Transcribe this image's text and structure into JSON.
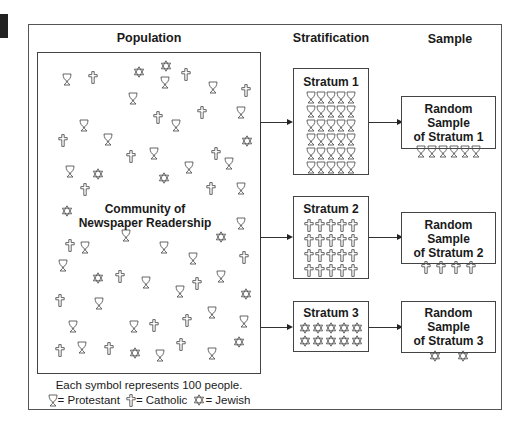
{
  "titles": {
    "population": "Population",
    "stratification": "Stratification",
    "sample": "Sample"
  },
  "population": {
    "label_line1": "Community of",
    "label_line2": "Newspaper Readership",
    "symbols": [
      {
        "t": "P",
        "x": 62,
        "y": 73
      },
      {
        "t": "C",
        "x": 88,
        "y": 71
      },
      {
        "t": "J",
        "x": 133,
        "y": 66
      },
      {
        "t": "P",
        "x": 160,
        "y": 76
      },
      {
        "t": "C",
        "x": 181,
        "y": 68
      },
      {
        "t": "P",
        "x": 208,
        "y": 81
      },
      {
        "t": "C",
        "x": 241,
        "y": 84
      },
      {
        "t": "P",
        "x": 128,
        "y": 92
      },
      {
        "t": "C",
        "x": 153,
        "y": 111
      },
      {
        "t": "C",
        "x": 197,
        "y": 106
      },
      {
        "t": "P",
        "x": 236,
        "y": 106
      },
      {
        "t": "P",
        "x": 79,
        "y": 119
      },
      {
        "t": "P",
        "x": 171,
        "y": 119
      },
      {
        "t": "C",
        "x": 58,
        "y": 134
      },
      {
        "t": "P",
        "x": 103,
        "y": 133
      },
      {
        "t": "J",
        "x": 241,
        "y": 135
      },
      {
        "t": "C",
        "x": 126,
        "y": 150
      },
      {
        "t": "P",
        "x": 149,
        "y": 147
      },
      {
        "t": "C",
        "x": 211,
        "y": 147
      },
      {
        "t": "P",
        "x": 224,
        "y": 157
      },
      {
        "t": "P",
        "x": 65,
        "y": 165
      },
      {
        "t": "J",
        "x": 92,
        "y": 168
      },
      {
        "t": "P",
        "x": 184,
        "y": 161
      },
      {
        "t": "J",
        "x": 158,
        "y": 172
      },
      {
        "t": "C",
        "x": 80,
        "y": 183
      },
      {
        "t": "C",
        "x": 206,
        "y": 182
      },
      {
        "t": "P",
        "x": 236,
        "y": 182
      },
      {
        "t": "J",
        "x": 61,
        "y": 205
      },
      {
        "t": "P",
        "x": 236,
        "y": 217
      },
      {
        "t": "J",
        "x": 215,
        "y": 231
      },
      {
        "t": "C",
        "x": 65,
        "y": 239
      },
      {
        "t": "P",
        "x": 80,
        "y": 241
      },
      {
        "t": "P",
        "x": 121,
        "y": 229
      },
      {
        "t": "P",
        "x": 159,
        "y": 241
      },
      {
        "t": "P",
        "x": 188,
        "y": 252
      },
      {
        "t": "C",
        "x": 239,
        "y": 251
      },
      {
        "t": "P",
        "x": 58,
        "y": 259
      },
      {
        "t": "J",
        "x": 92,
        "y": 272
      },
      {
        "t": "C",
        "x": 115,
        "y": 270
      },
      {
        "t": "P",
        "x": 141,
        "y": 276
      },
      {
        "t": "P",
        "x": 175,
        "y": 285
      },
      {
        "t": "C",
        "x": 192,
        "y": 277
      },
      {
        "t": "P",
        "x": 216,
        "y": 270
      },
      {
        "t": "J",
        "x": 240,
        "y": 288
      },
      {
        "t": "C",
        "x": 55,
        "y": 294
      },
      {
        "t": "P",
        "x": 94,
        "y": 297
      },
      {
        "t": "C",
        "x": 182,
        "y": 314
      },
      {
        "t": "P",
        "x": 207,
        "y": 306
      },
      {
        "t": "P",
        "x": 68,
        "y": 320
      },
      {
        "t": "P",
        "x": 129,
        "y": 320
      },
      {
        "t": "C",
        "x": 149,
        "y": 319
      },
      {
        "t": "P",
        "x": 239,
        "y": 315
      },
      {
        "t": "C",
        "x": 55,
        "y": 344
      },
      {
        "t": "P",
        "x": 77,
        "y": 341
      },
      {
        "t": "C",
        "x": 104,
        "y": 342
      },
      {
        "t": "J",
        "x": 129,
        "y": 347
      },
      {
        "t": "P",
        "x": 155,
        "y": 349
      },
      {
        "t": "C",
        "x": 176,
        "y": 338
      },
      {
        "t": "P",
        "x": 207,
        "y": 347
      },
      {
        "t": "J",
        "x": 233,
        "y": 336
      },
      {
        "t": "J",
        "x": 160,
        "y": 60
      }
    ]
  },
  "legend": {
    "line1": "Each symbol represents 100 people.",
    "items": [
      {
        "icon": "P",
        "label": "= Protestant"
      },
      {
        "icon": "C",
        "label": "= Catholic"
      },
      {
        "icon": "J",
        "label": "= Jewish"
      }
    ]
  },
  "strata": [
    {
      "title": "Stratum 1",
      "group": "Protestant",
      "icon": "P",
      "cols": 5,
      "count": 30
    },
    {
      "title": "Stratum 2",
      "group": "Catholic",
      "icon": "C",
      "cols": 5,
      "count": 20
    },
    {
      "title": "Stratum 3",
      "group": "Jewish",
      "icon": "J",
      "cols": 5,
      "count": 10
    }
  ],
  "samples": [
    {
      "line1": "Random Sample",
      "line2": "of Stratum 1",
      "icon": "P",
      "count": 6
    },
    {
      "line1": "Random Sample",
      "line2": "of Stratum 2",
      "icon": "C",
      "count": 4
    },
    {
      "line1": "Random Sample",
      "line2": "of Stratum 3",
      "icon": "J",
      "count": 2
    }
  ],
  "colors": {
    "line": "#333333",
    "symbol_stroke": "#555555",
    "text": "#1a1a1a"
  }
}
